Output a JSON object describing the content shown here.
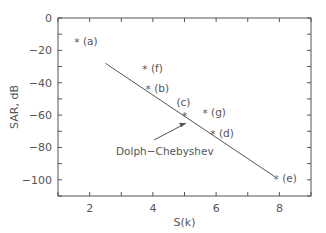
{
  "chart_data": {
    "type": "scatter",
    "title": "",
    "xlabel": "S(k)",
    "ylabel": "SAR, dB",
    "xlim": [
      1,
      9
    ],
    "ylim": [
      -110,
      0
    ],
    "xticks": [
      2,
      4,
      6,
      8
    ],
    "yticks": [
      0,
      -20,
      -40,
      -60,
      -80,
      -100
    ],
    "grid": false,
    "legend": null,
    "series": [
      {
        "name": "designs",
        "marker": "*",
        "points": [
          {
            "label": "(a)",
            "x": 1.6,
            "y": -14
          },
          {
            "label": "(f)",
            "x": 3.75,
            "y": -31
          },
          {
            "label": "(b)",
            "x": 3.85,
            "y": -43
          },
          {
            "label": "(c)",
            "x": 5.0,
            "y": -60
          },
          {
            "label": "(g)",
            "x": 5.65,
            "y": -58
          },
          {
            "label": "(d)",
            "x": 5.9,
            "y": -71
          },
          {
            "label": "(e)",
            "x": 7.9,
            "y": -99
          }
        ]
      },
      {
        "name": "Dolph-Chebyshev",
        "type": "line",
        "x": [
          2.5,
          7.85
        ],
        "y": [
          -28,
          -98
        ]
      }
    ],
    "annotations": [
      {
        "text": "Dolph−Chebyshev",
        "arrow_to": {
          "x": 5.05,
          "y": -65
        }
      }
    ]
  }
}
